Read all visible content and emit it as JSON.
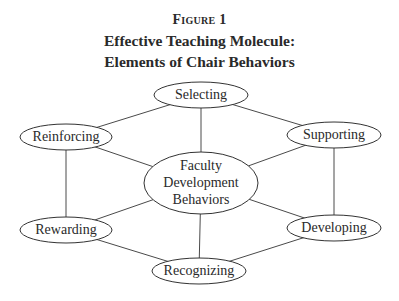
{
  "figure": {
    "label": "Figure 1",
    "title_line1": "Effective Teaching Molecule:",
    "title_line2": "Elements of Chair Behaviors"
  },
  "diagram": {
    "center_node": {
      "id": "faculty-development-behaviors",
      "lines": [
        "Faculty",
        "Development",
        "Behaviors"
      ],
      "cx": 201,
      "cy": 183,
      "rx": 57,
      "ry": 31
    },
    "nodes": [
      {
        "id": "selecting",
        "label": "Selecting",
        "cx": 201,
        "cy": 95,
        "rx": 47,
        "ry": 13
      },
      {
        "id": "supporting",
        "label": "Supporting",
        "cx": 334,
        "cy": 135,
        "rx": 47,
        "ry": 13
      },
      {
        "id": "developing",
        "label": "Developing",
        "cx": 334,
        "cy": 228,
        "rx": 47,
        "ry": 13
      },
      {
        "id": "recognizing",
        "label": "Recognizing",
        "cx": 199,
        "cy": 271,
        "rx": 47,
        "ry": 13
      },
      {
        "id": "rewarding",
        "label": "Rewarding",
        "cx": 66,
        "cy": 230,
        "rx": 46,
        "ry": 13
      },
      {
        "id": "reinforcing",
        "label": "Reinforcing",
        "cx": 66,
        "cy": 137,
        "rx": 46,
        "ry": 13
      }
    ],
    "edges": [
      {
        "from": "selecting",
        "to": "supporting"
      },
      {
        "from": "supporting",
        "to": "developing"
      },
      {
        "from": "developing",
        "to": "recognizing"
      },
      {
        "from": "recognizing",
        "to": "rewarding"
      },
      {
        "from": "rewarding",
        "to": "reinforcing"
      },
      {
        "from": "reinforcing",
        "to": "selecting"
      },
      {
        "from": "faculty-development-behaviors",
        "to": "selecting"
      },
      {
        "from": "faculty-development-behaviors",
        "to": "supporting"
      },
      {
        "from": "faculty-development-behaviors",
        "to": "developing"
      },
      {
        "from": "faculty-development-behaviors",
        "to": "recognizing"
      },
      {
        "from": "faculty-development-behaviors",
        "to": "rewarding"
      },
      {
        "from": "faculty-development-behaviors",
        "to": "reinforcing"
      }
    ]
  }
}
